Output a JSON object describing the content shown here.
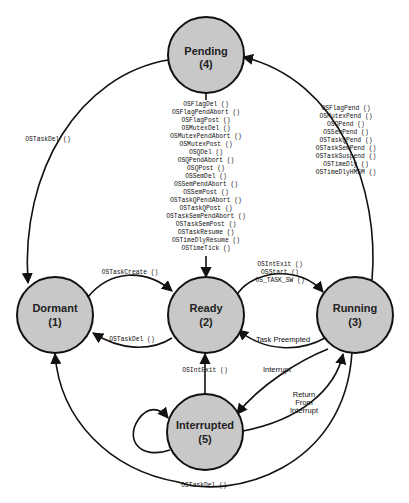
{
  "nodes": {
    "pending": {
      "name": "Pending",
      "num": "(4)"
    },
    "dormant": {
      "name": "Dormant",
      "num": "(1)"
    },
    "ready": {
      "name": "Ready",
      "num": "(2)"
    },
    "running": {
      "name": "Running",
      "num": "(3)"
    },
    "interrupted": {
      "name": "Interrupted",
      "num": "(5)"
    }
  },
  "edges": {
    "pending_to_ready": [
      "OSFlagDel ()",
      "OSFlagPendAbort ()",
      "OSFlagPost ()",
      "OSMutexDel ()",
      "OSMutexPendAbort ()",
      "OSMutexPost ()",
      "OSQDel ()",
      "OSQPendAbort ()",
      "OSQPost ()",
      "OSSemDel ()",
      "OSSemPendAbort ()",
      "OSSemPost ()",
      "OSTaskQPendAbort ()",
      "OSTaskQPost ()",
      "OSTaskSemPendAbort ()",
      "OSTaskSemPost ()",
      "OSTaskResume ()",
      "OSTimeDlyResume ()",
      "OSTimeTick ()"
    ],
    "running_to_pending": [
      "OSFlagPend ()",
      "OSMutexPend ()",
      "OSQPend ()",
      "OSSemPend ()",
      "OSTaskQPend ()",
      "OSTaskSemPend ()",
      "OSTaskSuspend ()",
      "OSTimeDly ()",
      "OSTimeDlyHMSM ()"
    ],
    "pending_to_dormant": "OSTaskDel ()",
    "dormant_to_ready": "OSTaskCreate ()",
    "ready_to_dormant": "OSTaskDel ()",
    "ready_to_running": [
      "OSIntExit ()",
      "OSStart ()",
      "OS_TASK_SW ()"
    ],
    "running_to_ready": "Task Preempted",
    "interrupted_to_ready": "OSIntExit ()",
    "running_to_interrupted": "Interrupt",
    "interrupted_to_running": [
      "Return",
      "From",
      "Interrupt"
    ],
    "running_to_dormant": "OSTaskDel ()"
  }
}
